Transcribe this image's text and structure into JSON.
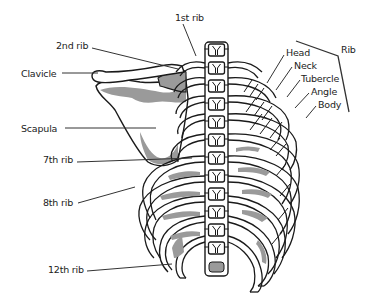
{
  "diagram": {
    "colors": {
      "outline": "#1a1a1a",
      "bone_fill": "#ffffff",
      "shading": "#9a9a9a",
      "leader_line": "#333333",
      "background": "#ffffff"
    },
    "labels": {
      "first_rib": {
        "text": "1st rib",
        "x": 175,
        "y": 13
      },
      "second_rib": {
        "text": "2nd rib",
        "x": 56,
        "y": 41
      },
      "clavicle": {
        "text": "Clavicle",
        "x": 21,
        "y": 69
      },
      "scapula": {
        "text": "Scapula",
        "x": 21,
        "y": 124
      },
      "seventh_rib": {
        "text": "7th rib",
        "x": 43,
        "y": 155
      },
      "eighth_rib": {
        "text": "8th rib",
        "x": 43,
        "y": 198
      },
      "twelfth_rib": {
        "text": "12th rib",
        "x": 48,
        "y": 265
      },
      "head": {
        "text": "Head",
        "x": 286,
        "y": 48
      },
      "neck": {
        "text": "Neck",
        "x": 294,
        "y": 61
      },
      "tubercle": {
        "text": "Tubercle",
        "x": 301,
        "y": 74
      },
      "angle": {
        "text": "Angle",
        "x": 311,
        "y": 87
      },
      "body": {
        "text": "Body",
        "x": 318,
        "y": 100
      },
      "rib_group": {
        "text": "Rib",
        "x": 341,
        "y": 45
      }
    },
    "leader_lines": [
      {
        "for": "1st rib",
        "x1": 183,
        "y1": 24,
        "x2": 196,
        "y2": 56
      },
      {
        "for": "2nd rib",
        "x1": 92,
        "y1": 48,
        "x2": 178,
        "y2": 69
      },
      {
        "for": "Clavicle",
        "x1": 62,
        "y1": 73,
        "x2": 98,
        "y2": 73
      },
      {
        "for": "Scapula",
        "x1": 65,
        "y1": 128,
        "x2": 156,
        "y2": 128
      },
      {
        "for": "7th rib",
        "x1": 77,
        "y1": 162,
        "x2": 192,
        "y2": 158
      },
      {
        "for": "8th rib",
        "x1": 78,
        "y1": 203,
        "x2": 135,
        "y2": 187
      },
      {
        "for": "12th rib",
        "x1": 87,
        "y1": 271,
        "x2": 172,
        "y2": 264
      },
      {
        "for": "Head",
        "x1": 284,
        "y1": 55,
        "x2": 267,
        "y2": 83
      },
      {
        "for": "Neck",
        "x1": 292,
        "y1": 67,
        "x2": 276,
        "y2": 90
      },
      {
        "for": "Tubercle",
        "x1": 300,
        "y1": 80,
        "x2": 287,
        "y2": 97
      },
      {
        "for": "Angle",
        "x1": 309,
        "y1": 93,
        "x2": 295,
        "y2": 108
      },
      {
        "for": "Body",
        "x1": 316,
        "y1": 106,
        "x2": 306,
        "y2": 118
      }
    ],
    "rib_bracket": {
      "points": "296,41 338,56 349,112"
    },
    "vertebrae_count": 12,
    "rib_pairs_drawn": 12
  }
}
